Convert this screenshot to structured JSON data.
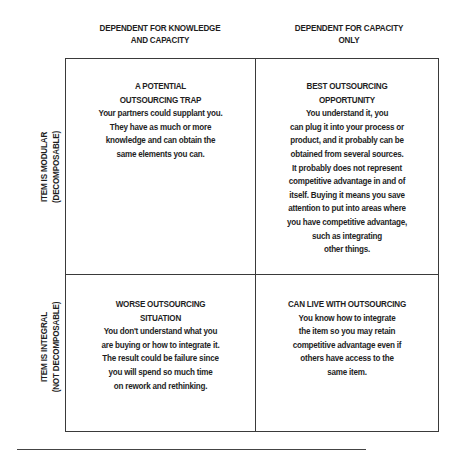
{
  "column_headers": [
    {
      "lines": [
        "DEPENDENT FOR KNOWLEDGE",
        "AND CAPACITY"
      ]
    },
    {
      "lines": [
        "DEPENDENT FOR CAPACITY",
        "ONLY"
      ]
    }
  ],
  "row_headers": [
    {
      "lines": [
        "ITEM IS MODULAR",
        "(DECOMPOSABLE)"
      ]
    },
    {
      "lines": [
        "ITEM IS INTEGRAL",
        "(NOT DECOMPOSABLE)"
      ]
    }
  ],
  "cells": {
    "top_left": {
      "lines": [
        "A POTENTIAL",
        "OUTSOURCING TRAP",
        "Your partners could supplant you.",
        "They have as much or more",
        "knowledge and can obtain the",
        "same elements you can."
      ]
    },
    "top_right": {
      "lines": [
        "BEST OUTSOURCING",
        "OPPORTUNITY",
        "You understand it, you",
        "can plug it into your process or",
        "product, and it probably can be",
        "obtained from several sources.",
        "It probably does not represent",
        "competitive advantage in and of",
        "itself. Buying it means you save",
        "attention to put into areas where",
        "you have competitive advantage,",
        "such as integrating",
        "other things."
      ]
    },
    "bottom_left": {
      "lines": [
        "WORSE OUTSOURCING",
        "SITUATION",
        "You don't understand what you",
        "are buying or how to integrate it.",
        "The result could be failure since",
        "you will spend so much time",
        "on rework and rethinking."
      ]
    },
    "bottom_right": {
      "lines": [
        "CAN LIVE WITH OUTSOURCING",
        "You know how to integrate",
        "the item so you may retain",
        "competitive advantage even if",
        "others have access to the",
        "same item."
      ]
    }
  },
  "colors": {
    "text": "#1e1e1e",
    "border": "#3a3a3a",
    "background": "#ffffff"
  }
}
